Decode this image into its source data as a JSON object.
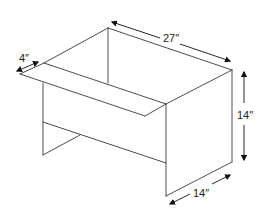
{
  "diagram": {
    "type": "isometric-dimension-drawing",
    "dimensions": {
      "length": "27″",
      "overhang": "4″",
      "height": "14″",
      "depth": "14″"
    },
    "colors": {
      "line": "#3a3a3a",
      "arrow": "#111111",
      "background": "#ffffff"
    }
  }
}
